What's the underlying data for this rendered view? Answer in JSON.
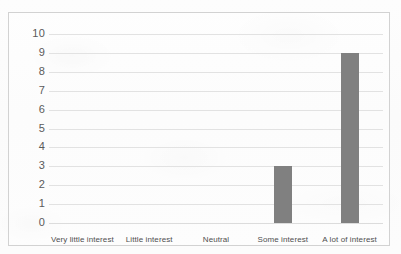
{
  "chart_data": {
    "type": "bar",
    "title": "",
    "subtitle": "",
    "xlabel": "",
    "ylabel": "",
    "categories": [
      "Very little interest",
      "Little interest",
      "Neutral",
      "Some interest",
      "A lot of interest"
    ],
    "values": [
      0,
      0,
      0,
      3,
      9
    ],
    "ylim": [
      0,
      10
    ],
    "ytick_labels": [
      "10",
      "9",
      "8",
      "7",
      "6",
      "5",
      "4",
      "3",
      "2",
      "1",
      "0"
    ],
    "ytick_values": [
      10,
      9,
      8,
      7,
      6,
      5,
      4,
      3,
      2,
      1,
      0
    ],
    "ytick_step": 1,
    "grid": true,
    "grid_orientation": "horizontal",
    "legend": false,
    "legend_position": "none",
    "bar_color": "#808080",
    "gridline_color": "#e2e2e2",
    "border_color": "#d2d2d2",
    "background_color": "#fcfcfc",
    "tick_label_color": "#5a5a5a"
  }
}
